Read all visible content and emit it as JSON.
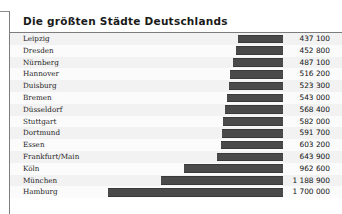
{
  "header": {
    "title": "Die größten Städte Deutschlands"
  },
  "colors": {
    "bar": "#4a4a4a",
    "bar_edge": "#3a3a3a",
    "row_even": "#f2f2f2",
    "row_odd": "#fbfbfb",
    "frame": "#7d7d7d",
    "text": "#1c1c1c",
    "title_text": "#1a1a1a"
  },
  "chart_data": {
    "type": "bar",
    "orientation": "horizontal",
    "title": "Die größten Städte Deutschlands",
    "xlabel": "",
    "ylabel": "",
    "grid": false,
    "legend": null,
    "value_labels": true,
    "bar_alignment": "right-aligned",
    "xlim": [
      0,
      1700000
    ],
    "categories": [
      "Leipzig",
      "Dresden",
      "Nürnberg",
      "Hannover",
      "Duisburg",
      "Bremen",
      "Düsseldorf",
      "Stuttgart",
      "Dortmund",
      "Essen",
      "Frankfurt/Main",
      "Köln",
      "München",
      "Hamburg"
    ],
    "values": [
      437100,
      452800,
      487100,
      516200,
      523300,
      543000,
      568400,
      582000,
      591700,
      603200,
      643900,
      962600,
      1188900,
      1700000
    ],
    "value_labels_text": [
      "437 100",
      "452 800",
      "487 100",
      "516 200",
      "523 300",
      "543 000",
      "568 400",
      "582 000",
      "591 700",
      "603 200",
      "643 900",
      "962 600",
      "1 188 900",
      "1 700 000"
    ]
  }
}
